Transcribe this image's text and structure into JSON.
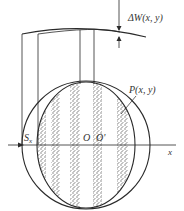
{
  "diagram": {
    "type": "lateral shearing interferogram",
    "labels": {
      "delta_w": "ΔW(x, y)",
      "point": "P(x, y)",
      "shear": "S",
      "shear_sub": "x",
      "origin": "O",
      "origin_shifted": "O'",
      "x_axis": "x"
    },
    "colors": {
      "line": "#2a2a2a",
      "stipple": "#8a8a8a",
      "background": "#ffffff"
    },
    "fringes": [
      {
        "x1": 38,
        "x2": 46
      },
      {
        "x1": 51,
        "x2": 60
      },
      {
        "x1": 70,
        "x2": 80
      },
      {
        "x1": 93,
        "x2": 102
      },
      {
        "x1": 117,
        "x2": 128
      }
    ]
  }
}
